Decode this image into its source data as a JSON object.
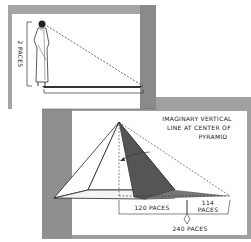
{
  "figure": {
    "top_panel": {
      "height_label": "2 PACES",
      "shadow_label": "3 PACES"
    },
    "bottom_panel": {
      "annotation_line1": "IMAGINARY VERTICAL",
      "annotation_line2": "LINE AT CENTER OF",
      "annotation_line3": "PYRAMID",
      "half_base_label": "120 PACES",
      "shadow_label_num": "114",
      "shadow_label_unit": "PACES",
      "total_label": "240 PACES"
    },
    "colors": {
      "frame": "#9a9a9a",
      "frame_dark": "#6e6e6e",
      "ink": "#222222",
      "shadow": "#4a4a4a"
    }
  }
}
